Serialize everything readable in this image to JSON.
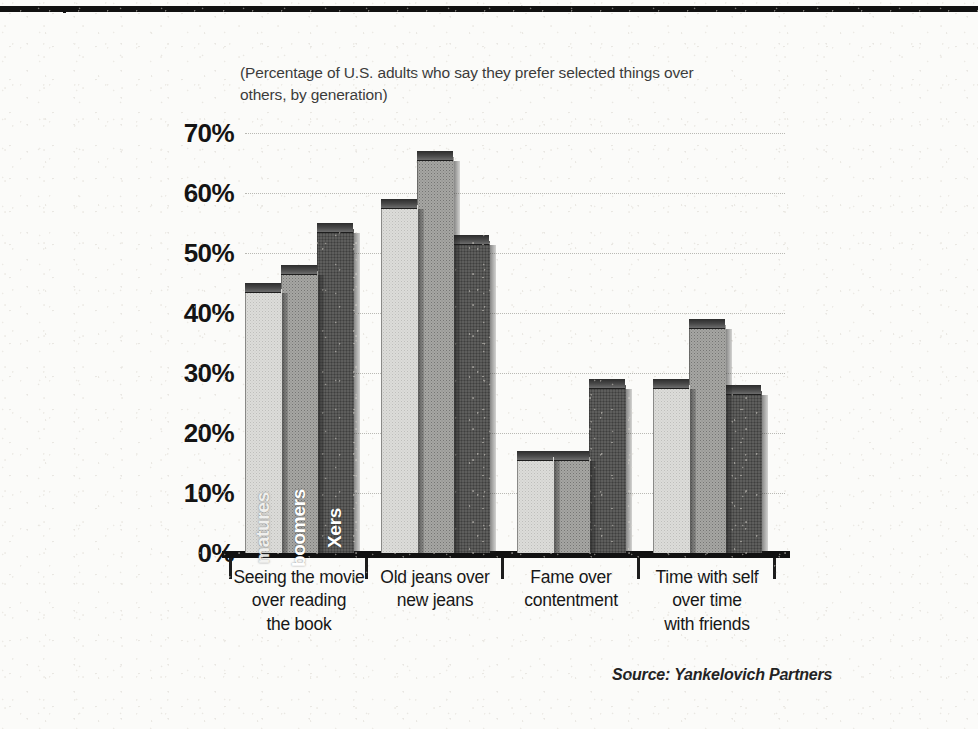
{
  "page": {
    "top_rule": true,
    "background_color": "#fbfbf9"
  },
  "subtitle": "(Percentage of U.S. adults who say they prefer selected things over others, by generation)",
  "source": "Source: Yankelovich Partners",
  "series_inbar_labels": {
    "matures": "matures",
    "boomers": "boomers",
    "xers": "Xers"
  },
  "chart_data": {
    "type": "bar",
    "title": "",
    "subtitle": "(Percentage of U.S. adults who say they prefer selected things over others, by generation)",
    "xlabel": "",
    "ylabel": "",
    "ylim": [
      0,
      70
    ],
    "ytick_step": 10,
    "ytick_labels": [
      "70%",
      "60%",
      "50%",
      "40%",
      "30%",
      "20%",
      "10%",
      "0%"
    ],
    "ytick_values": [
      70,
      60,
      50,
      40,
      30,
      20,
      10,
      0
    ],
    "grid": true,
    "grid_axis": "y",
    "grid_style": "dotted",
    "legend": "in-bar vertical labels on first group",
    "legend_position": "inside-bars",
    "categories": [
      "Seeing the movie over reading the book",
      "Old jeans over new jeans",
      "Fame over contentment",
      "Time with self over time with friends"
    ],
    "category_lines": [
      [
        "Seeing the movie",
        "over reading",
        "the book"
      ],
      [
        "Old jeans over",
        "new jeans"
      ],
      [
        "Fame over",
        "contentment"
      ],
      [
        "Time with self",
        "over time",
        "with friends"
      ]
    ],
    "series": [
      {
        "name": "matures",
        "color": "#dcdcd9",
        "values": [
          44,
          58,
          16,
          28
        ]
      },
      {
        "name": "boomers",
        "color": "#a6a6a3",
        "values": [
          47,
          66,
          16,
          38
        ]
      },
      {
        "name": "Xers",
        "color": "#6f6f6d",
        "values": [
          54,
          52,
          28,
          27
        ]
      }
    ],
    "units": "percent",
    "note": "3D extruded bars, scanned print reproduction"
  }
}
